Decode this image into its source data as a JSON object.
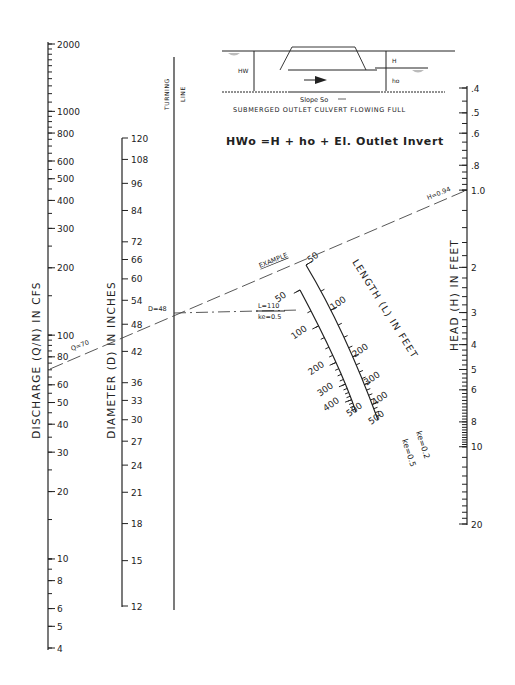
{
  "chart_data": {
    "type": "nomograph",
    "scales": {
      "discharge": {
        "label": "DISCHARGE (Q/N) IN CFS",
        "ticks": [
          "2000",
          "1000",
          "800",
          "600",
          "500",
          "400",
          "300",
          "200",
          "100",
          "80",
          "60",
          "50",
          "40",
          "30",
          "20",
          "10",
          "8",
          "6",
          "5",
          "4"
        ],
        "range": [
          4,
          2000
        ]
      },
      "diameter": {
        "label": "DIAMETER (D) IN INCHES",
        "ticks": [
          "120",
          "108",
          "96",
          "84",
          "72",
          "66",
          "60",
          "54",
          "48",
          "42",
          "36",
          "33",
          "30",
          "27",
          "24",
          "21",
          "18",
          "15",
          "12"
        ],
        "range": [
          12,
          120
        ]
      },
      "turning_line": {
        "label_line1": "TURNING",
        "label_line2": "LINE"
      },
      "length_ke_02": {
        "label": "LENGTH (L) IN FEET",
        "ticks": [
          "50",
          "100",
          "200",
          "300",
          "400",
          "500"
        ],
        "ke_label": "ke=0.2"
      },
      "length_ke_05": {
        "ticks": [
          "50",
          "100",
          "200",
          "300",
          "400",
          "500"
        ],
        "ke_label": "ke=0.5"
      },
      "head": {
        "label": "HEAD (H) IN FEET",
        "ticks": [
          ".4",
          ".5",
          ".6",
          ".8",
          "1.0",
          "2",
          "3",
          "4",
          "5",
          "6",
          "8",
          "10",
          "20"
        ],
        "range": [
          0.4,
          20
        ]
      }
    },
    "example": {
      "label": "EXAMPLE",
      "Q": "Q=70",
      "D": "D=48",
      "L": "L=110",
      "ke": "ke=0.5",
      "H": "H=0.94"
    },
    "inset": {
      "labels": {
        "hw": "HW",
        "h": "H",
        "ho": "ho",
        "slope": "Slope So"
      },
      "caption": "SUBMERGED OUTLET CULVERT FLOWING FULL",
      "equation": "HWo =H + ho + El. Outlet Invert"
    }
  }
}
